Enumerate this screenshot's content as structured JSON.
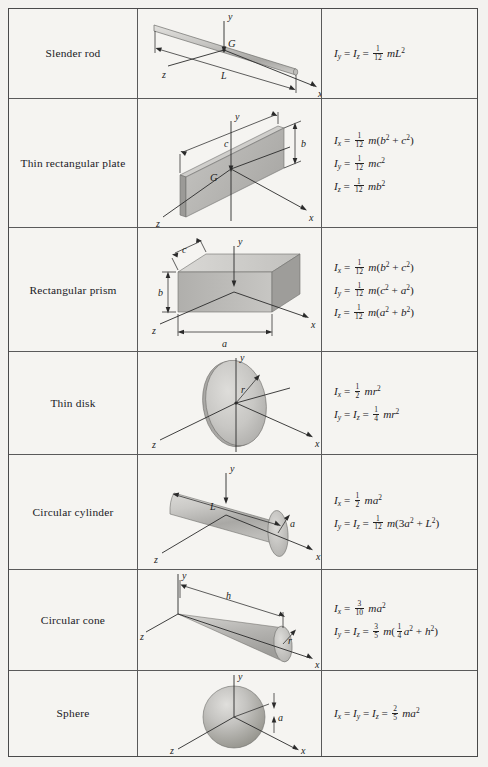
{
  "table": {
    "columns": [
      "Shape",
      "Diagram",
      "Moments of inertia"
    ],
    "rows": [
      {
        "name": "Slender rod",
        "figure": "slender-rod",
        "diagram_labels": [
          "y",
          "G",
          "z",
          "L",
          "x"
        ],
        "formulas": [
          "I_y = I_z = (1/12) m L^2"
        ],
        "formula_lines": [
          {
            "lhs": [
              "I_y",
              "I_z"
            ],
            "coefficient_num": "1",
            "coefficient_den": "12",
            "body": "mL²"
          }
        ]
      },
      {
        "name": "Thin rectangular plate",
        "figure": "thin-rectangular-plate",
        "diagram_labels": [
          "y",
          "c",
          "b",
          "G",
          "z",
          "x"
        ],
        "formulas": [
          "I_x = (1/12) m (b^2 + c^2)",
          "I_y = (1/12) m c^2",
          "I_z = (1/12) m b^2"
        ],
        "formula_lines": [
          {
            "lhs": [
              "I_x"
            ],
            "coefficient_num": "1",
            "coefficient_den": "12",
            "body": "m(b² + c²)"
          },
          {
            "lhs": [
              "I_y"
            ],
            "coefficient_num": "1",
            "coefficient_den": "12",
            "body": "mc²"
          },
          {
            "lhs": [
              "I_z"
            ],
            "coefficient_num": "1",
            "coefficient_den": "12",
            "body": "mb²"
          }
        ]
      },
      {
        "name": "Rectangular prism",
        "figure": "rectangular-prism",
        "diagram_labels": [
          "y",
          "c",
          "b",
          "z",
          "a",
          "x"
        ],
        "formulas": [
          "I_x = (1/12) m (b^2 + c^2)",
          "I_y = (1/12) m (c^2 + a^2)",
          "I_z = (1/12) m (a^2 + b^2)"
        ],
        "formula_lines": [
          {
            "lhs": [
              "I_x"
            ],
            "coefficient_num": "1",
            "coefficient_den": "12",
            "body": "m(b² + c²)"
          },
          {
            "lhs": [
              "I_y"
            ],
            "coefficient_num": "1",
            "coefficient_den": "12",
            "body": "m(c² + a²)"
          },
          {
            "lhs": [
              "I_z"
            ],
            "coefficient_num": "1",
            "coefficient_den": "12",
            "body": "m(a² + b²)"
          }
        ]
      },
      {
        "name": "Thin disk",
        "figure": "thin-disk",
        "diagram_labels": [
          "y",
          "r",
          "z",
          "x"
        ],
        "formulas": [
          "I_x = (1/2) m r^2",
          "I_y = I_z = (1/4) m r^2"
        ],
        "formula_lines": [
          {
            "lhs": [
              "I_x"
            ],
            "coefficient_num": "1",
            "coefficient_den": "2",
            "body": "mr²"
          },
          {
            "lhs": [
              "I_y",
              "I_z"
            ],
            "coefficient_num": "1",
            "coefficient_den": "4",
            "body": "mr²"
          }
        ]
      },
      {
        "name": "Circular cylinder",
        "figure": "circular-cylinder",
        "diagram_labels": [
          "y",
          "L",
          "a",
          "z",
          "x"
        ],
        "formulas": [
          "I_x = (1/2) m a^2",
          "I_y = I_z = (1/12) m (3a^2 + L^2)"
        ],
        "formula_lines": [
          {
            "lhs": [
              "I_x"
            ],
            "coefficient_num": "1",
            "coefficient_den": "2",
            "body": "ma²"
          },
          {
            "lhs": [
              "I_y",
              "I_z"
            ],
            "coefficient_num": "1",
            "coefficient_den": "12",
            "body": "m(3a² + L²)"
          }
        ]
      },
      {
        "name": "Circular cone",
        "figure": "circular-cone",
        "diagram_labels": [
          "y",
          "h",
          "z",
          "r",
          "x"
        ],
        "formulas": [
          "I_x = (3/10) m a^2",
          "I_y = I_z = (3/5) m ((1/4) a^2 + h^2)"
        ],
        "formula_lines": [
          {
            "lhs": [
              "I_x"
            ],
            "coefficient_num": "3",
            "coefficient_den": "10",
            "body": "ma²"
          },
          {
            "lhs": [
              "I_y",
              "I_z"
            ],
            "coefficient_num": "3",
            "coefficient_den": "5",
            "body": "m(¼a² + h²)"
          }
        ]
      },
      {
        "name": "Sphere",
        "figure": "sphere",
        "diagram_labels": [
          "y",
          "a",
          "z",
          "x"
        ],
        "formulas": [
          "I_x = I_y = I_z = (2/5) m a^2"
        ],
        "formula_lines": [
          {
            "lhs": [
              "I_x",
              "I_y",
              "I_z"
            ],
            "coefficient_num": "2",
            "coefficient_den": "5",
            "body": "ma²"
          }
        ]
      }
    ]
  },
  "colors": {
    "page_background": "#f2f1ee",
    "table_background": "#f5f4f1",
    "border": "#4a4a4a",
    "text": "#1d1d1d",
    "shape_fill_light": "#d8d7d4",
    "shape_fill_mid": "#bcbbb8",
    "shape_fill_dark": "#a3a29f"
  }
}
